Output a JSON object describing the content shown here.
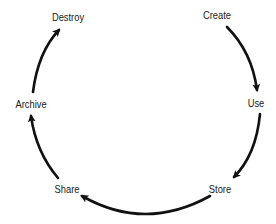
{
  "diagram": {
    "type": "cycle",
    "stages": [
      {
        "id": "create",
        "label": "Create",
        "x": 217,
        "y": 15
      },
      {
        "id": "use",
        "label": "Use",
        "x": 256,
        "y": 103
      },
      {
        "id": "store",
        "label": "Store",
        "x": 220,
        "y": 189
      },
      {
        "id": "share",
        "label": "Share",
        "x": 67,
        "y": 189
      },
      {
        "id": "archive",
        "label": "Archive",
        "x": 31,
        "y": 104
      },
      {
        "id": "destroy",
        "label": "Destroy",
        "x": 68,
        "y": 17
      }
    ],
    "arrows": [
      {
        "from": "create",
        "to": "use"
      },
      {
        "from": "use",
        "to": "store"
      },
      {
        "from": "store",
        "to": "share"
      },
      {
        "from": "share",
        "to": "archive"
      },
      {
        "from": "archive",
        "to": "destroy"
      }
    ],
    "colors": {
      "arrow": "#111111",
      "text": "#1a1a1a",
      "background": "#ffffff"
    }
  }
}
